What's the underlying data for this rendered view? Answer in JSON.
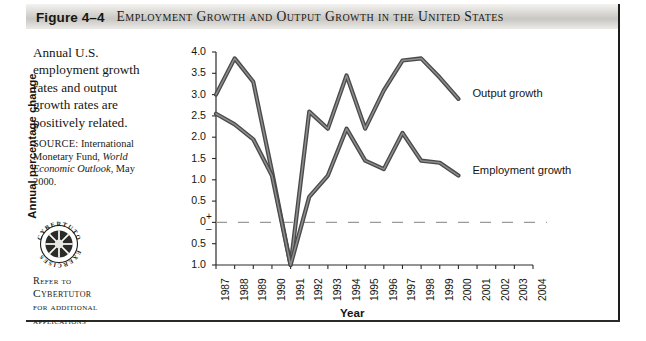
{
  "figure": {
    "number": "Figure 4–4",
    "title": "Employment Growth and Output Growth in the United States"
  },
  "caption": {
    "lead": "Annual U.S. employment growth rates and output growth rates are positively related.",
    "source_label": "SOURCE:",
    "source_text_1": " International Monetary Fund, ",
    "source_italic": "World Economic Outlook",
    "source_text_2": ", May 2000."
  },
  "badge": {
    "ring_text_top": "CYBERTUTOR",
    "ring_text_bottom": "EXERCISES",
    "refer_line_1": "Refer to",
    "refer_line_2": "Cybertutor",
    "refer_line_3": "for additional",
    "refer_line_4": "applications"
  },
  "chart_data": {
    "type": "line",
    "title": "Employment Growth and Output Growth in the United States",
    "xlabel": "Year",
    "ylabel": "Annual percentage change",
    "x": [
      1987,
      1988,
      1989,
      1990,
      1991,
      1992,
      1993,
      1994,
      1995,
      1996,
      1997,
      1998,
      1999,
      2000
    ],
    "xlim": [
      1987,
      2004
    ],
    "xticks": [
      "1987",
      "1988",
      "1989",
      "1990",
      "1991",
      "1992",
      "1993",
      "1994",
      "1995",
      "1996",
      "1997",
      "1998",
      "1999",
      "2000",
      "2001",
      "2002",
      "2003",
      "2004"
    ],
    "ylim": [
      -1.0,
      4.0
    ],
    "yticks": [
      "4.0",
      "3.5",
      "3.0",
      "2.5",
      "2.0",
      "1.5",
      "1.0",
      "0.5",
      "0",
      "0.5",
      "1.0"
    ],
    "ytick_values": [
      4.0,
      3.5,
      3.0,
      2.5,
      2.0,
      1.5,
      1.0,
      0.5,
      0,
      -0.5,
      -1.0
    ],
    "positive_sign": "+",
    "negative_sign": "–",
    "grid": false,
    "zero_line": "dashed",
    "legend_position": "right-inline",
    "series": [
      {
        "name": "Output growth",
        "color": "#5a5a5a",
        "values": [
          3.0,
          3.85,
          3.3,
          1.2,
          -1.0,
          2.6,
          2.2,
          3.45,
          2.2,
          3.1,
          3.8,
          3.85,
          3.4,
          2.9
        ]
      },
      {
        "name": "Employment growth",
        "color": "#5a5a5a",
        "values": [
          2.55,
          2.3,
          1.95,
          1.1,
          -1.0,
          0.6,
          1.1,
          2.2,
          1.45,
          1.25,
          2.1,
          1.45,
          1.4,
          1.1
        ]
      }
    ]
  }
}
